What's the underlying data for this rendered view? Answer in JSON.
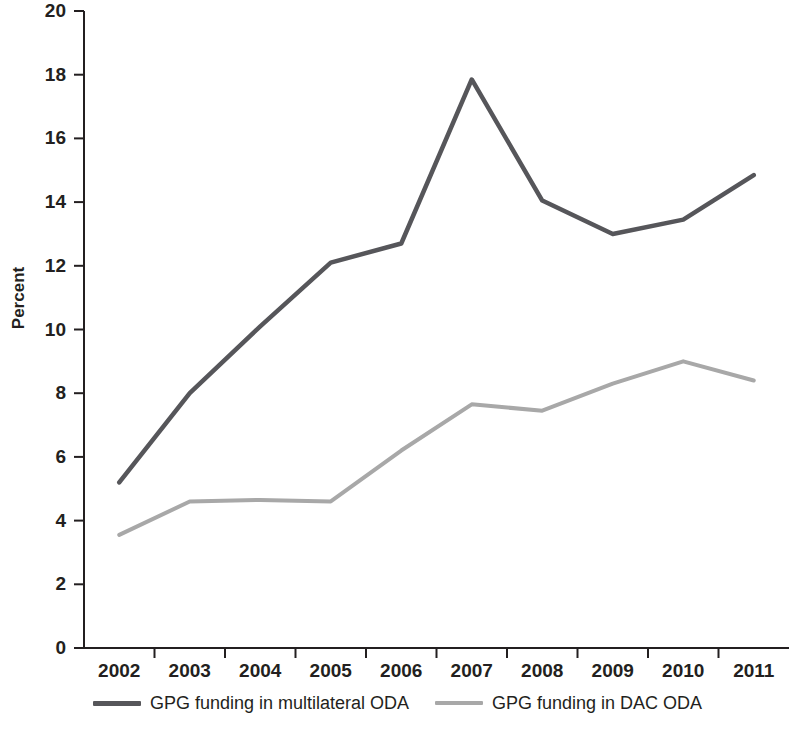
{
  "chart_data": {
    "type": "line",
    "title": "",
    "subtitle": "",
    "xlabel": "",
    "ylabel": "Percent",
    "categories": [
      "2002",
      "2003",
      "2004",
      "2005",
      "2006",
      "2007",
      "2008",
      "2009",
      "2010",
      "2011"
    ],
    "x": [
      2002,
      2003,
      2004,
      2005,
      2006,
      2007,
      2008,
      2009,
      2010,
      2011
    ],
    "series": [
      {
        "name": "GPG funding in multilateral ODA",
        "color": "#56565a",
        "values": [
          5.2,
          8.0,
          10.1,
          12.1,
          12.7,
          17.85,
          14.05,
          13.0,
          13.45,
          14.85
        ]
      },
      {
        "name": "GPG funding in DAC ODA",
        "color": "#a8a8a8",
        "values": [
          3.55,
          4.6,
          4.65,
          4.6,
          6.2,
          7.65,
          7.45,
          8.3,
          9.0,
          8.4
        ]
      }
    ],
    "ylim": [
      0,
      20
    ],
    "ytick_values": [
      0,
      2,
      4,
      6,
      8,
      10,
      12,
      14,
      16,
      18,
      20
    ],
    "ytick_labels": [
      "0",
      "2",
      "4",
      "6",
      "8",
      "10",
      "12",
      "14",
      "16",
      "18",
      "20"
    ],
    "xtick_labels": [
      "2002",
      "2003",
      "2004",
      "2005",
      "2006",
      "2007",
      "2008",
      "2009",
      "2010",
      "2011"
    ],
    "grid": false,
    "legend_position": "bottom",
    "axis_color": "#231f20"
  },
  "legend": {
    "entries": [
      {
        "label": "GPG funding in multilateral ODA",
        "color": "#56565a"
      },
      {
        "label": "GPG funding in DAC ODA",
        "color": "#a8a8a8"
      }
    ]
  }
}
